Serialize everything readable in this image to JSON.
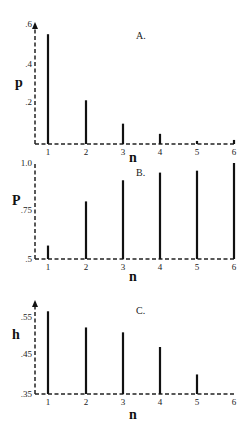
{
  "chart_data": [
    {
      "type": "bar",
      "title": "A.",
      "xlabel": "n",
      "ylabel": "p",
      "categories": [
        "1",
        "2",
        "3",
        "4",
        "5",
        "6"
      ],
      "values": [
        0.54,
        0.215,
        0.1,
        0.05,
        0.015,
        0.02
      ],
      "yticks": [
        ".2",
        ".4",
        ".6"
      ],
      "ytick_values": [
        0.2,
        0.4,
        0.6
      ],
      "ylim": [
        0,
        0.6
      ],
      "y_axis_arrow": true,
      "grid": false,
      "legend": null
    },
    {
      "type": "bar",
      "title": "B.",
      "xlabel": "n",
      "ylabel": "P",
      "categories": [
        "1",
        "2",
        "3",
        "4",
        "5",
        "6"
      ],
      "values": [
        0.57,
        0.8,
        0.91,
        0.95,
        0.96,
        1.0
      ],
      "yticks": [
        ".5",
        ".75",
        "1.0"
      ],
      "ytick_values": [
        0.5,
        0.75,
        1.0
      ],
      "ylim": [
        0.5,
        1.0
      ],
      "y_axis_arrow": false,
      "grid": false,
      "legend": null
    },
    {
      "type": "bar",
      "title": "C.",
      "xlabel": "n",
      "ylabel": "h",
      "categories": [
        "1",
        "2",
        "3",
        "4",
        "5",
        "6"
      ],
      "values": [
        0.57,
        0.527,
        0.514,
        0.475,
        0.402,
        null
      ],
      "yticks": [
        ".35",
        ".45",
        ".55"
      ],
      "ytick_values": [
        0.35,
        0.45,
        0.55
      ],
      "ylim": [
        0.35,
        0.6
      ],
      "y_axis_arrow": true,
      "grid": false,
      "legend": null
    }
  ],
  "panels": [
    {
      "box": {
        "x0": 35,
        "x1": 235,
        "yTop": 22,
        "yBase": 144,
        "vMin": 0,
        "vMax": 0.6
      },
      "xPositions": [
        48,
        86,
        123,
        160,
        197,
        234
      ],
      "tickY": [
        {
          "label": ".6",
          "y": 27
        },
        {
          "label": ".4",
          "y": 67
        },
        {
          "label": ".2",
          "y": 105
        }
      ],
      "ylabelPos": {
        "x": 15,
        "y": 87
      },
      "titlePos": {
        "x": 136,
        "y": 39
      },
      "xlabelPos": {
        "x": 133,
        "y": 162
      }
    },
    {
      "box": {
        "x0": 35,
        "x1": 235,
        "yTop": 163,
        "yBase": 259,
        "vMin": 0.5,
        "vMax": 1.0
      },
      "xPositions": [
        48,
        86,
        123,
        160,
        197,
        234
      ],
      "tickY": [
        {
          "label": "1.0",
          "y": 166
        },
        {
          "label": ".75",
          "y": 213
        },
        {
          "label": ".5",
          "y": 262
        }
      ],
      "ylabelPos": {
        "x": 12,
        "y": 205
      },
      "titlePos": {
        "x": 136,
        "y": 176
      },
      "xlabelPos": {
        "x": 133,
        "y": 281
      }
    },
    {
      "box": {
        "x0": 35,
        "x1": 235,
        "yTop": 300,
        "yBase": 394,
        "vMin": 0.35,
        "vMax": 0.6
      },
      "xPositions": [
        48,
        86,
        123,
        160,
        197,
        234
      ],
      "tickY": [
        {
          "label": ".55",
          "y": 320
        },
        {
          "label": ".45",
          "y": 357
        },
        {
          "label": ".35",
          "y": 397
        }
      ],
      "ylabelPos": {
        "x": 12,
        "y": 339
      },
      "titlePos": {
        "x": 136,
        "y": 314
      },
      "xlabelPos": {
        "x": 133,
        "y": 419
      }
    }
  ]
}
